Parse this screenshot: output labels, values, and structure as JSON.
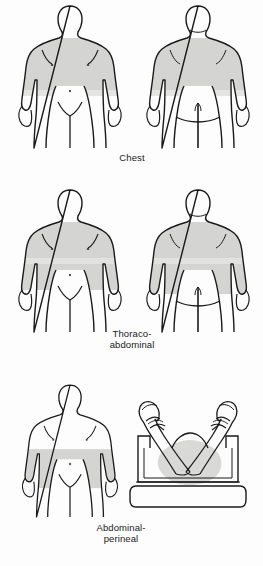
{
  "illustration": {
    "title": "Surgical skin preparation areas",
    "background_color": "#fdfdfd",
    "outline_color": "#1a1a1a",
    "prep_shade_color": "#d4d4d2",
    "prep_shade_light_color": "#e2e2e0"
  },
  "rows": [
    {
      "id": "chest",
      "caption": "Chest",
      "figures": [
        {
          "id": "chest-anterior",
          "view": "anterior",
          "subject": "adult-male-body-outline",
          "prep_area": "shoulders-to-waist, front torso including upper arms"
        },
        {
          "id": "chest-posterior",
          "view": "posterior",
          "subject": "adult-male-body-outline",
          "prep_area": "shoulders-to-waist, back torso including upper arms"
        }
      ]
    },
    {
      "id": "thoraco-abdominal",
      "caption": "Thoraco-\nabdominal",
      "figures": [
        {
          "id": "thoraco-anterior",
          "view": "anterior",
          "subject": "adult-male-body-outline",
          "prep_area": "shoulders to lower abdomen, front torso"
        },
        {
          "id": "thoraco-posterior",
          "view": "posterior",
          "subject": "adult-male-body-outline",
          "prep_area": "shoulders to buttocks, back torso"
        }
      ]
    },
    {
      "id": "abdominal-perineal",
      "caption": "Abdominal-\nperineal",
      "figures": [
        {
          "id": "abperi-anterior",
          "view": "anterior",
          "subject": "adult-male-body-outline",
          "prep_area": "waist to groin, lower abdomen"
        },
        {
          "id": "abperi-lithotomy",
          "view": "lithotomy-position",
          "subject": "patient-in-stirrups-on-operating-table",
          "prep_area": "perineum and inner thighs"
        }
      ]
    }
  ]
}
